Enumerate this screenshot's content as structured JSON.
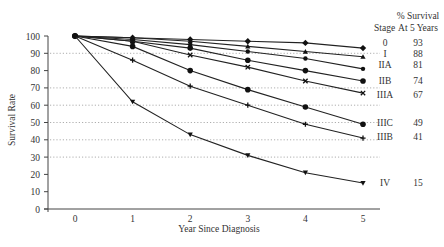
{
  "chart_data": {
    "type": "line",
    "title": "",
    "xlabel": "Year Since Diagnosis",
    "ylabel": "Survival Rate",
    "x": [
      0,
      1,
      2,
      3,
      4,
      5
    ],
    "xticks": [
      "0",
      "1",
      "2",
      "3",
      "4",
      "5"
    ],
    "yticks": [
      "0",
      "10",
      "20",
      "30",
      "40",
      "50",
      "60",
      "70",
      "80",
      "90",
      "100"
    ],
    "ylim": [
      0,
      100
    ],
    "gridlines_y": [
      30,
      40,
      50,
      60,
      70,
      90
    ],
    "grid": "dotted horizontal",
    "legend_header": {
      "stage": "Stage",
      "survival_line1": "% Survival",
      "survival_line2": "At 5 Years"
    },
    "series": [
      {
        "name": "0",
        "marker": "diamond",
        "values": [
          100,
          99,
          98,
          97,
          96,
          93
        ],
        "survival_5yr": "93"
      },
      {
        "name": "I",
        "marker": "triangle",
        "values": [
          100,
          99,
          97,
          94,
          91,
          88
        ],
        "survival_5yr": "88"
      },
      {
        "name": "IIA",
        "marker": "star",
        "values": [
          100,
          98,
          95,
          91,
          87,
          81
        ],
        "survival_5yr": "81"
      },
      {
        "name": "IIB",
        "marker": "circle",
        "values": [
          100,
          97,
          93,
          86,
          80,
          74
        ],
        "survival_5yr": "74"
      },
      {
        "name": "IIIA",
        "marker": "cross",
        "values": [
          100,
          97,
          89,
          82,
          74,
          67
        ],
        "survival_5yr": "67"
      },
      {
        "name": "IIIC",
        "marker": "circle",
        "values": [
          100,
          94,
          80,
          69,
          59,
          49
        ],
        "survival_5yr": "49"
      },
      {
        "name": "IIIB",
        "marker": "plus",
        "values": [
          100,
          86,
          71,
          60,
          49,
          41
        ],
        "survival_5yr": "41"
      },
      {
        "name": "IV",
        "marker": "triangle-down",
        "values": [
          100,
          62,
          43,
          31,
          21,
          15
        ],
        "survival_5yr": "15"
      }
    ]
  }
}
